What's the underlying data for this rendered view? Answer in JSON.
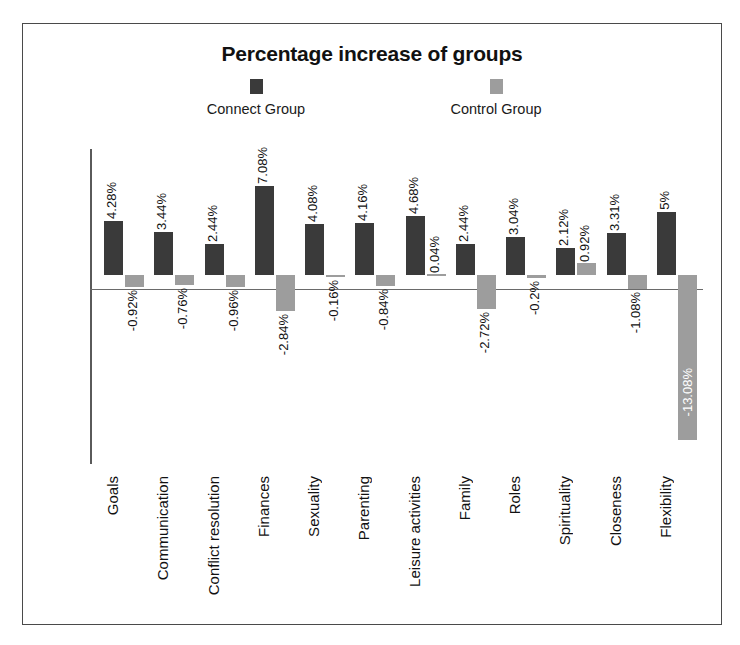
{
  "figure": {
    "title": "Percentage increase of groups",
    "border_color": "#4a4a4a",
    "background": "#ffffff"
  },
  "legend": {
    "position": "top-center",
    "entries": [
      {
        "label": "Connect Group",
        "color": "#3a3a3a",
        "swatch_name": "legend-swatch-connect"
      },
      {
        "label": "Control Group",
        "color": "#9d9d9d",
        "swatch_name": "legend-swatch-control"
      }
    ]
  },
  "axes": {
    "y_ticks": [
      "10%",
      "5%",
      "0%",
      "-5%",
      "-10%",
      "-15%"
    ],
    "y_values": [
      10,
      5,
      0,
      -5,
      -10,
      -15
    ],
    "ylim": [
      -15,
      10
    ],
    "grid": false,
    "zero_line_color": "#6a6a6a",
    "axis_line_color": "#5a5a5a"
  },
  "chart_data": {
    "type": "bar",
    "title": "Percentage increase of groups",
    "xlabel": "",
    "ylabel": "",
    "ylim": [
      -15,
      10
    ],
    "grid": false,
    "legend_position": "top-center",
    "categories": [
      "Goals",
      "Communication",
      "Conflict resolution",
      "Finances",
      "Sexuality",
      "Parenting",
      "Leisure activities",
      "Family",
      "Roles",
      "Spirituality",
      "Closeness",
      "Flexibility"
    ],
    "series": [
      {
        "name": "Connect Group",
        "color": "#3a3a3a",
        "values": [
          4.28,
          3.44,
          2.44,
          7.08,
          4.08,
          4.16,
          4.68,
          2.44,
          3.04,
          2.12,
          3.31,
          5
        ],
        "labels": [
          "4.28%",
          "3.44%",
          "2.44%",
          "7.08%",
          "4.08%",
          "4.16%",
          "4.68%",
          "2.44%",
          "3.04%",
          "2.12%",
          "3.31%",
          "5%"
        ]
      },
      {
        "name": "Control Group",
        "color": "#9d9d9d",
        "values": [
          -0.92,
          -0.76,
          -0.96,
          -2.84,
          -0.16,
          -0.84,
          0.04,
          -2.72,
          -0.2,
          0.92,
          -1.08,
          -13.08
        ],
        "labels": [
          "-0.92%",
          "-0.76%",
          "-0.96%",
          "-2.84%",
          "-0.16%",
          "-0.84%",
          "0.04%",
          "-2.72%",
          "-0.2%",
          "0.92%",
          "-1.08%",
          "-13.08%"
        ]
      }
    ]
  }
}
